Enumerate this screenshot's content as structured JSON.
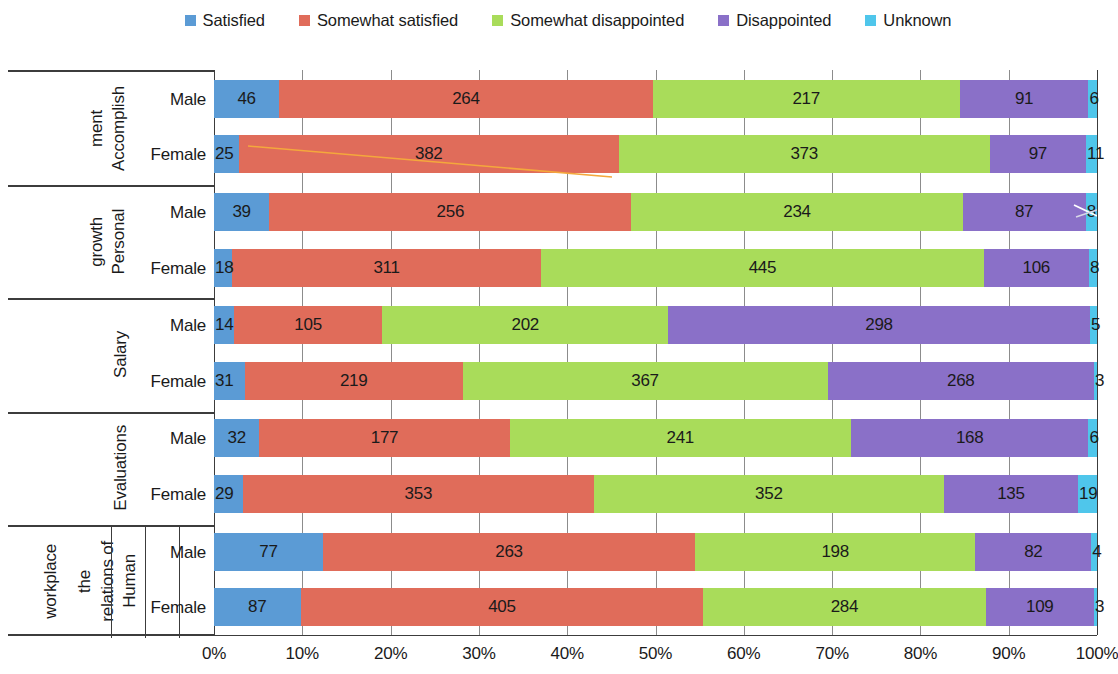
{
  "legend": {
    "position": "top-center",
    "items": [
      {
        "label": "Satisfied",
        "color": "#5B9BD5"
      },
      {
        "label": "Somewhat satisfied",
        "color": "#E06C5A"
      },
      {
        "label": "Somewhat disappointed",
        "color": "#A9DC5A"
      },
      {
        "label": "Disappointed",
        "color": "#8A70C8"
      },
      {
        "label": "Unknown",
        "color": "#4FC6EB"
      }
    ]
  },
  "axis": {
    "ticks": [
      "0%",
      "10%",
      "20%",
      "30%",
      "40%",
      "50%",
      "60%",
      "70%",
      "80%",
      "90%",
      "100%"
    ],
    "min": 0,
    "max": 100
  },
  "row_labels": {
    "male": "Male",
    "female": "Female"
  },
  "chart_data": {
    "type": "bar",
    "orientation": "horizontal",
    "stacked": true,
    "normalized": true,
    "title": "",
    "xlabel": "",
    "ylabel": "",
    "xlim": [
      0,
      100
    ],
    "grid": true,
    "legend_position": "top-center",
    "series": [
      {
        "name": "Satisfied",
        "color": "#5B9BD5"
      },
      {
        "name": "Somewhat satisfied",
        "color": "#E06C5A"
      },
      {
        "name": "Somewhat disappointed",
        "color": "#A9DC5A"
      },
      {
        "name": "Disappointed",
        "color": "#8A70C8"
      },
      {
        "name": "Unknown",
        "color": "#4FC6EB"
      }
    ],
    "categories": [
      {
        "name": "Accomplishment",
        "lines": [
          "Accomplish",
          "ment"
        ],
        "rows": [
          {
            "label": "Male",
            "values": [
              46,
              264,
              217,
              91,
              6
            ]
          },
          {
            "label": "Female",
            "values": [
              25,
              382,
              373,
              97,
              11
            ]
          }
        ]
      },
      {
        "name": "Personal growth",
        "lines": [
          "Personal",
          "growth"
        ],
        "rows": [
          {
            "label": "Male",
            "values": [
              39,
              256,
              234,
              87,
              8
            ]
          },
          {
            "label": "Female",
            "values": [
              18,
              311,
              445,
              106,
              8
            ]
          }
        ]
      },
      {
        "name": "Salary",
        "lines": [
          "Salary"
        ],
        "rows": [
          {
            "label": "Male",
            "values": [
              14,
              105,
              202,
              298,
              5
            ]
          },
          {
            "label": "Female",
            "values": [
              31,
              219,
              367,
              268,
              3
            ]
          }
        ]
      },
      {
        "name": "Evaluations",
        "lines": [
          "Evaluations"
        ],
        "rows": [
          {
            "label": "Male",
            "values": [
              32,
              177,
              241,
              168,
              6
            ]
          },
          {
            "label": "Female",
            "values": [
              29,
              353,
              352,
              135,
              19
            ]
          }
        ]
      },
      {
        "name": "Human relations of the workplace",
        "lines": [
          "Human",
          "relations of",
          "the",
          "workplace"
        ],
        "line_columns": [
          [
            "Human",
            "relations of"
          ],
          [
            "the"
          ],
          [
            "workplace"
          ]
        ],
        "rows": [
          {
            "label": "Male",
            "values": [
              77,
              263,
              198,
              82,
              4
            ]
          },
          {
            "label": "Female",
            "values": [
              87,
              405,
              284,
              109,
              3
            ]
          }
        ]
      }
    ]
  }
}
